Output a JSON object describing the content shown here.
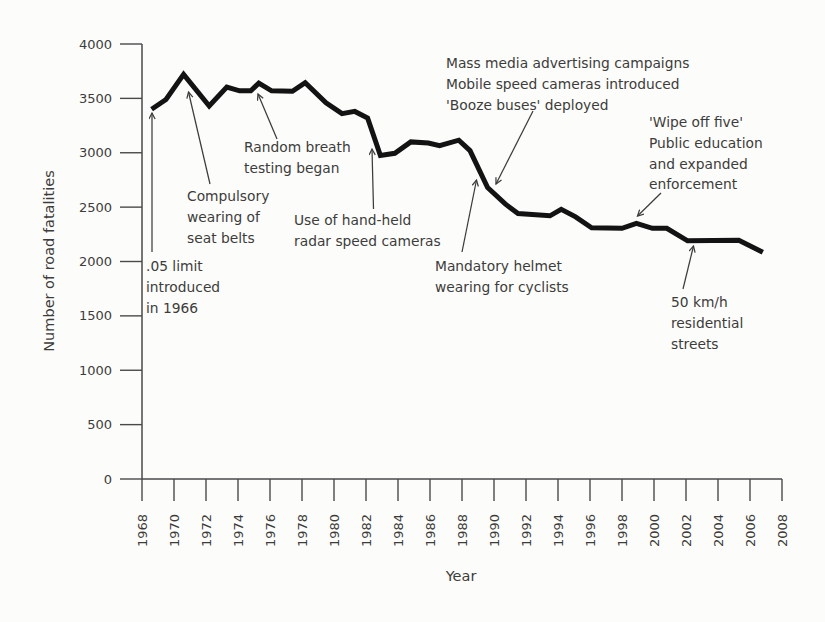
{
  "figure": {
    "kind": "scanned-statistical-figure",
    "xlabel": "Year",
    "ylabel": "Number of road fatalities"
  },
  "chart_data": {
    "type": "line",
    "title": "",
    "xlabel": "Year",
    "ylabel": "Number of road fatalities",
    "xlim": [
      1968,
      2008
    ],
    "ylim": [
      0,
      4000
    ],
    "grid": false,
    "x_ticks": [
      1968,
      1970,
      1972,
      1974,
      1976,
      1978,
      1980,
      1982,
      1984,
      1986,
      1988,
      1990,
      1992,
      1994,
      1996,
      1998,
      2000,
      2002,
      2004,
      2006,
      2008
    ],
    "y_ticks": [
      0,
      500,
      1000,
      1500,
      2000,
      2500,
      3000,
      3500,
      4000
    ],
    "colors": {
      "line": "#131313",
      "axis": "#4a4a4a",
      "text": "#3c3c3c",
      "background": "#fcfcfa"
    },
    "series": [
      {
        "name": "Road fatalities",
        "points": [
          [
            1968.6,
            3400
          ],
          [
            1969.5,
            3490
          ],
          [
            1970.6,
            3720
          ],
          [
            1972.2,
            3430
          ],
          [
            1973.3,
            3605
          ],
          [
            1974.1,
            3570
          ],
          [
            1974.8,
            3570
          ],
          [
            1975.3,
            3640
          ],
          [
            1976.1,
            3570
          ],
          [
            1977.4,
            3565
          ],
          [
            1978.2,
            3645
          ],
          [
            1979.5,
            3460
          ],
          [
            1980.5,
            3360
          ],
          [
            1981.3,
            3380
          ],
          [
            1982.1,
            3320
          ],
          [
            1982.9,
            2975
          ],
          [
            1983.8,
            2995
          ],
          [
            1984.8,
            3100
          ],
          [
            1985.9,
            3090
          ],
          [
            1986.6,
            3065
          ],
          [
            1987.8,
            3115
          ],
          [
            1988.5,
            3020
          ],
          [
            1989.6,
            2680
          ],
          [
            1990.7,
            2530
          ],
          [
            1991.5,
            2440
          ],
          [
            1993.5,
            2420
          ],
          [
            1994.2,
            2480
          ],
          [
            1995.1,
            2410
          ],
          [
            1996.1,
            2310
          ],
          [
            1998.0,
            2305
          ],
          [
            1998.9,
            2350
          ],
          [
            1999.9,
            2305
          ],
          [
            2000.8,
            2305
          ],
          [
            2002.1,
            2190
          ],
          [
            2005.3,
            2195
          ],
          [
            2006.8,
            2085
          ]
        ]
      }
    ],
    "annotations": [
      {
        "id": "limit-05",
        "lines": [
          ".05 limit",
          "introduced",
          "in 1966"
        ],
        "target_year": 1969
      },
      {
        "id": "seat-belts",
        "lines": [
          "Compulsory",
          "wearing of",
          "seat belts"
        ],
        "target_year": 1971
      },
      {
        "id": "random-breath",
        "lines": [
          "Random breath",
          "testing began"
        ],
        "target_year": 1976
      },
      {
        "id": "radar",
        "lines": [
          "Use of hand-held",
          "radar speed cameras"
        ],
        "target_year": 1983
      },
      {
        "id": "mass-media",
        "lines": [
          "Mass media advertising campaigns",
          "Mobile speed cameras introduced",
          "'Booze buses' deployed"
        ],
        "target_year": 1990
      },
      {
        "id": "helmet",
        "lines": [
          "Mandatory helmet",
          "wearing for cyclists"
        ],
        "target_year": 1989
      },
      {
        "id": "wipe-off-five",
        "lines": [
          "'Wipe off five'",
          "Public education",
          "and expanded",
          "enforcement"
        ],
        "target_year": 1999
      },
      {
        "id": "fifty-kmh",
        "lines": [
          "50 km/h",
          "residential",
          "streets"
        ],
        "target_year": 2003
      }
    ]
  }
}
